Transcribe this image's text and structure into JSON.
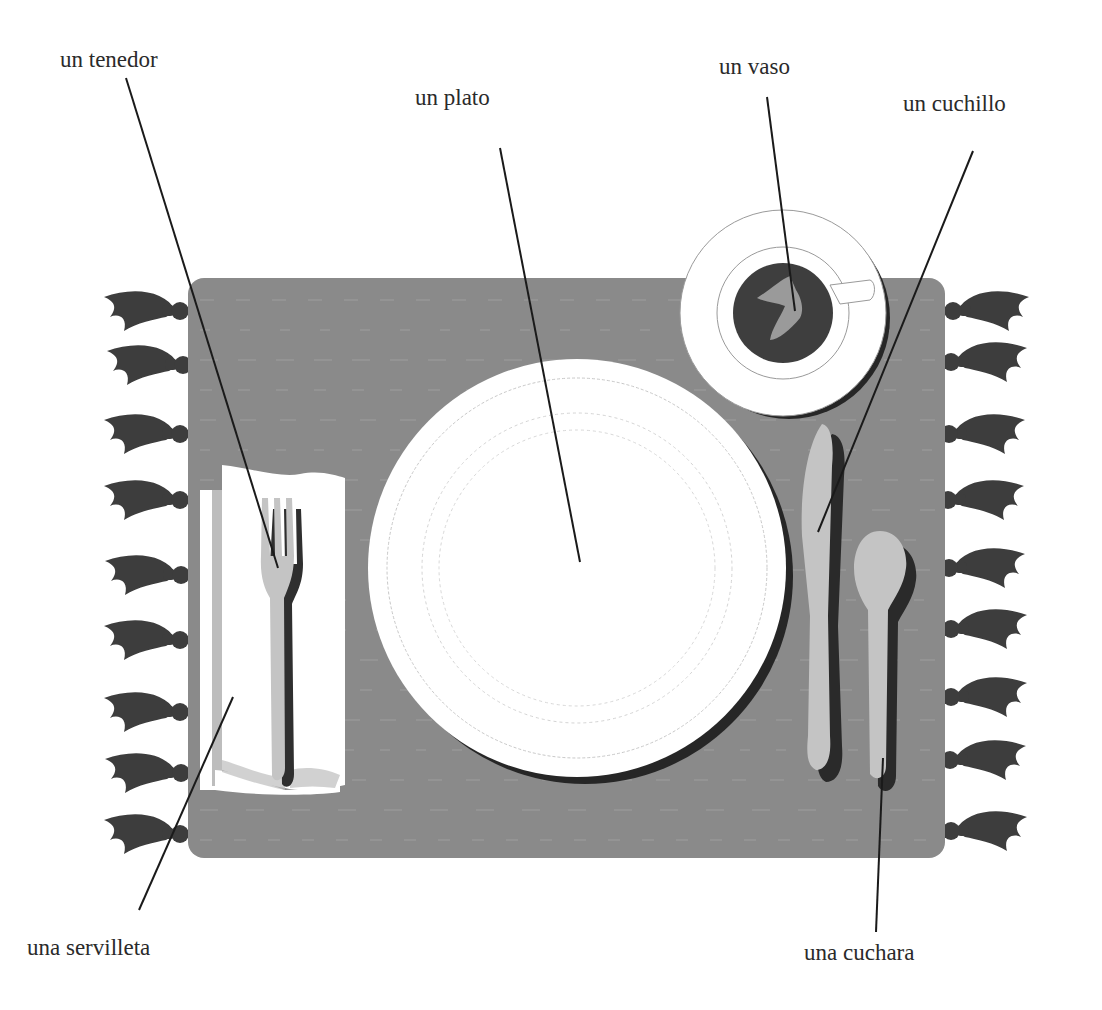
{
  "diagram": {
    "type": "labeled-illustration",
    "colors": {
      "background": "#ffffff",
      "placemat": "#8a8a8a",
      "tassel": "#3d3d3d",
      "plate": "#ffffff",
      "plate_shadow": "#262626",
      "cutlery": "#c4c4c4",
      "cutlery_shadow": "#2a2a2a",
      "coffee": "#3e3e3e",
      "coffee_swirl": "#9a9a9a",
      "napkin": "#ffffff",
      "napkin_edge": "#bdbdbd",
      "leader_line": "#1a1a1a",
      "label_text": "#2a2a2a"
    },
    "labels": [
      {
        "id": "tenedor",
        "text": "un tenedor"
      },
      {
        "id": "plato",
        "text": "un plato"
      },
      {
        "id": "vaso",
        "text": "un vaso"
      },
      {
        "id": "cuchillo",
        "text": "un cuchillo"
      },
      {
        "id": "servilleta",
        "text": "una servilleta"
      },
      {
        "id": "cuchara",
        "text": "una cuchara"
      }
    ]
  }
}
